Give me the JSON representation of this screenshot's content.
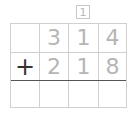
{
  "problem": {
    "carry": "1",
    "operator": "+",
    "top_number": [
      "3",
      "1",
      "4"
    ],
    "bottom_number": [
      "2",
      "1",
      "8"
    ],
    "answer": [
      "",
      "",
      "",
      ""
    ]
  },
  "colors": {
    "grid_line": "#d0d0d0",
    "sum_line": "#555555",
    "digit": "#b5b5b5",
    "operator": "#333333"
  }
}
